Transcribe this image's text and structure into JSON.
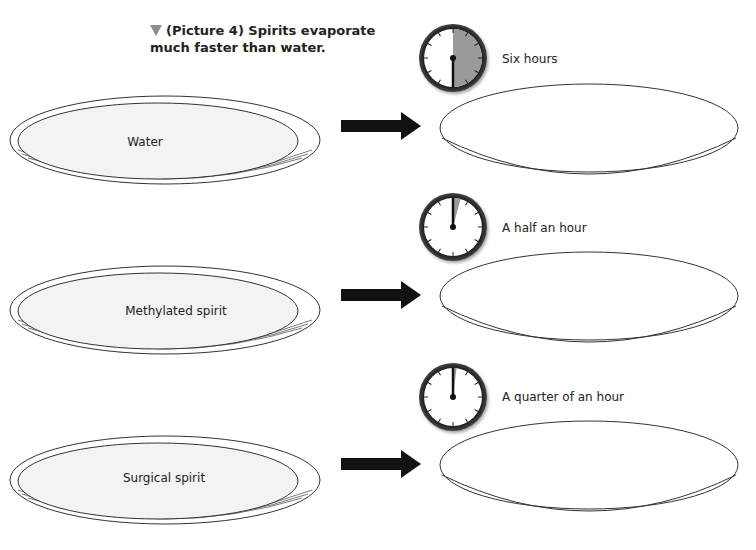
{
  "caption": {
    "marker_icon": "down-triangle-icon",
    "text": "(Picture 4) Spirits evaporate much faster than water."
  },
  "colors": {
    "liquid_fill": "#f3f3f3",
    "outline": "#333333",
    "clock_elapsed": "#9a9a9a",
    "arrow": "#111111",
    "marker": "#8e8e8e"
  },
  "rows": [
    {
      "liquid": "Water",
      "time_label": "Six hours",
      "clock_elapsed_fraction": 0.5
    },
    {
      "liquid": "Methylated spirit",
      "time_label": "A half an hour",
      "clock_elapsed_fraction": 0.04
    },
    {
      "liquid": "Surgical spirit",
      "time_label": "A quarter of an hour",
      "clock_elapsed_fraction": 0.02
    }
  ]
}
